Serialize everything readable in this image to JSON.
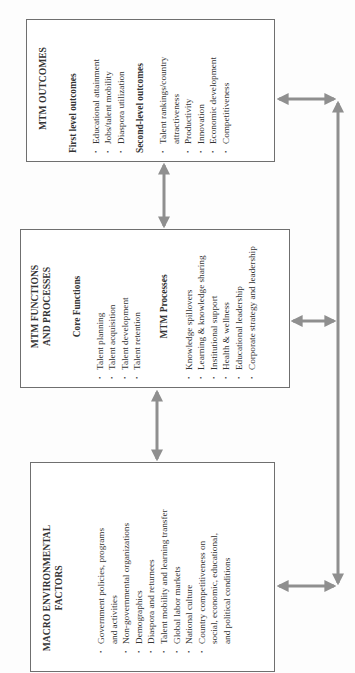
{
  "diagram": {
    "orientation": "rotated-90-ccw",
    "colors": {
      "border": "#6f6f6f",
      "arrow": "#8f8f8f",
      "text": "#333333"
    },
    "boxes": {
      "outcomes": {
        "title": "MTM OUTCOMES",
        "sections": [
          {
            "heading": "First level outcomes",
            "items": [
              "Educational attainment",
              "Jobs/talent mobility",
              "Diaspora utilization"
            ]
          },
          {
            "heading": "Second-level outcomes",
            "items": [
              "Talent rankings/country attractiveness",
              "Productivity",
              "Innovation",
              "Economic development",
              "Competitiveness"
            ]
          }
        ]
      },
      "functions": {
        "title": "MTM FUNCTIONS AND PROCESSES",
        "sections": [
          {
            "heading": "Core Functions",
            "items": [
              "Talent planning",
              "Talent acquisition",
              "Talent development",
              "Talent retention"
            ]
          },
          {
            "heading": "MTM Processes",
            "items": [
              "Knowledge spillovers",
              "Learning & knowledge sharing",
              "Institutional support",
              "Health & wellness",
              "Educational leadership",
              "Corporate strategy and leadership"
            ]
          }
        ]
      },
      "macro": {
        "title": "MACRO ENVIRONMENTAL FACTORS",
        "items": [
          "Government policies, programs and activities",
          "Non-governmental organizations",
          "Demographics",
          "Diaspora and returnees",
          "Talent mobility and learning transfer",
          "Global labor markets",
          "National culture",
          "Country competitiveness on social, economic, educational, and political conditions"
        ]
      }
    },
    "connectors": [
      {
        "from": "outcomes",
        "to": "functions",
        "type": "bidirectional"
      },
      {
        "from": "functions",
        "to": "macro",
        "type": "bidirectional"
      },
      {
        "from": "outcomes",
        "to": "feedback-loop",
        "type": "bidirectional"
      },
      {
        "from": "functions",
        "to": "feedback-loop",
        "type": "bidirectional"
      },
      {
        "from": "macro",
        "to": "feedback-loop",
        "type": "bidirectional"
      }
    ]
  }
}
